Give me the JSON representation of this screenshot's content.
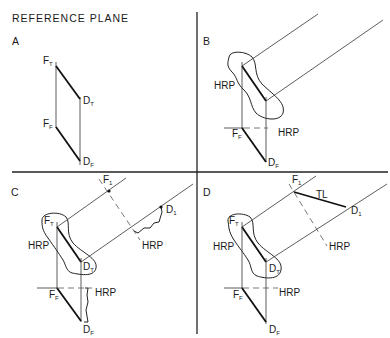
{
  "title": "REFERENCE PLANE",
  "panels": {
    "A": {
      "letter": "A",
      "labels": {
        "ft": {
          "main": "F",
          "sub": "T"
        },
        "dt": {
          "main": "D",
          "sub": "T"
        },
        "ff": {
          "main": "F",
          "sub": "F"
        },
        "df": {
          "main": "D",
          "sub": "F"
        }
      }
    },
    "B": {
      "letter": "B",
      "hrp_top": "HRP",
      "hrp_bottom": "HRP",
      "labels": {
        "ff": {
          "main": "F",
          "sub": "F"
        },
        "df": {
          "main": "D",
          "sub": "F"
        }
      }
    },
    "C": {
      "letter": "C",
      "hrp_top": "HRP",
      "hrp_aux": "HRP",
      "hrp_bottom": "HRP",
      "labels": {
        "f1": {
          "main": "F",
          "sub": "1"
        },
        "d1": {
          "main": "D",
          "sub": "1"
        },
        "ft": {
          "main": "F",
          "sub": "T"
        },
        "dt": {
          "main": "D",
          "sub": "T"
        },
        "ff": {
          "main": "F",
          "sub": "F"
        },
        "df": {
          "main": "D",
          "sub": "F"
        }
      }
    },
    "D": {
      "letter": "D",
      "hrp_top": "HRP",
      "hrp_aux": "HRP",
      "hrp_bottom": "HRP",
      "tl": "TL",
      "labels": {
        "f1": {
          "main": "F",
          "sub": "1"
        },
        "d1": {
          "main": "D",
          "sub": "1"
        },
        "ft": {
          "main": "F",
          "sub": "T"
        },
        "dt": {
          "main": "D",
          "sub": "T"
        },
        "ff": {
          "main": "F",
          "sub": "F"
        },
        "df": {
          "main": "D",
          "sub": "F"
        }
      }
    }
  }
}
